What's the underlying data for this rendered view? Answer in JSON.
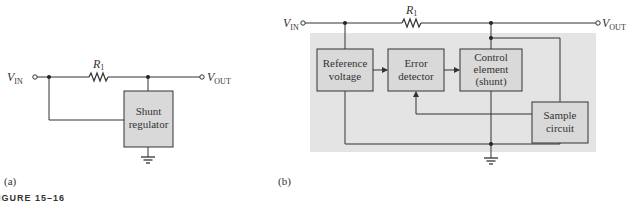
{
  "figure": {
    "caption_partial": "IGURE 15–16",
    "colors": {
      "line": "#333333",
      "box_fill": "#d9d9d9",
      "shade": "#e4e4e4"
    }
  },
  "panel_a": {
    "label": "(a)",
    "vin_label": "V",
    "vin_sub": "IN",
    "vout_label": "V",
    "vout_sub": "OUT",
    "resistor_label": "R",
    "resistor_sub": "1",
    "blocks": [
      {
        "id": "shunt-regulator",
        "lines": [
          "Shunt",
          "regulator"
        ]
      }
    ]
  },
  "panel_b": {
    "label": "(b)",
    "vin_label": "V",
    "vin_sub": "IN",
    "vout_label": "V",
    "vout_sub": "OUT",
    "resistor_label": "R",
    "resistor_sub": "1",
    "blocks": [
      {
        "id": "reference-voltage",
        "lines": [
          "Reference",
          "voltage"
        ]
      },
      {
        "id": "error-detector",
        "lines": [
          "Error",
          "detector"
        ]
      },
      {
        "id": "control-element",
        "lines": [
          "Control",
          "element",
          "(shunt)"
        ]
      },
      {
        "id": "sample-circuit",
        "lines": [
          "Sample",
          "circuit"
        ]
      }
    ]
  }
}
